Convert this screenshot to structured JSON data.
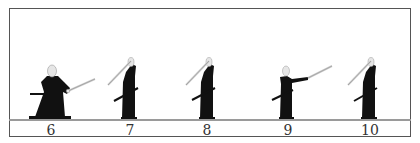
{
  "figure": {
    "steps": [
      {
        "number": "6",
        "pose": "low wide stance, sword extended forward"
      },
      {
        "number": "7",
        "pose": "standing, sword raised overhead"
      },
      {
        "number": "8",
        "pose": "standing, sword raised overhead"
      },
      {
        "number": "9",
        "pose": "standing, sword extended forward"
      },
      {
        "number": "10",
        "pose": "standing, sword raised overhead"
      }
    ]
  },
  "colors": {
    "figure": "#111111",
    "border": "#555555",
    "ground": "#9a9a9a",
    "blade": "#cfcfcf",
    "skin": "#e6e6e6"
  }
}
